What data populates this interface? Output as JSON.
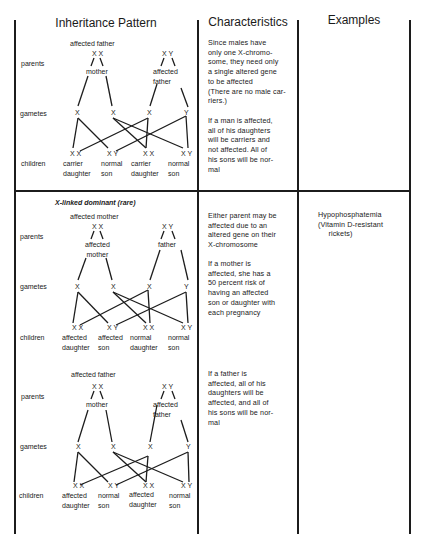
{
  "table": {
    "headers": [
      "Inheritance Pattern",
      "Characteristics",
      "Examples"
    ],
    "sections": [
      {
        "id": "x-linked-recessive-father",
        "title": "",
        "row_labels": {
          "parents": "parents",
          "gametes": "gametes",
          "children": "children"
        },
        "parent_left_label_top": "affected father",
        "parent_left_genotype": "X X",
        "parent_left_label_bottom": "mother",
        "parent_right_genotype": "X Y",
        "parent_right_label": "affected\nfather",
        "gametes": [
          "X",
          "X",
          "X",
          "Y"
        ],
        "children_genotypes": [
          "X X",
          "X Y",
          "X X",
          "X Y"
        ],
        "children_labels": [
          "carrier\ndaughter",
          "normal\nson",
          "carrier\ndaughter",
          "normal\nson"
        ],
        "characteristics": [
          "Since males have\nonly one X-chromo-\nsome, they need only\na single altered gene\nto be affected\n(There are no male car-\nriers.)",
          "If a man is affected,\nall of his daughters\nwill be carriers and\nnot affected. All of\nhis sons will be nor-\nmal"
        ],
        "examples": ""
      },
      {
        "id": "x-linked-dominant-mother",
        "title": "X-linked dominant (rare)",
        "row_labels": {
          "parents": "parents",
          "gametes": "gametes",
          "children": "children"
        },
        "parent_left_label_top": "affected mother",
        "parent_left_genotype": "X X",
        "parent_left_label_bottom": "affected\nmother",
        "parent_right_genotype": "X Y",
        "parent_right_label": "father",
        "gametes": [
          "X",
          "X",
          "X",
          "Y"
        ],
        "children_genotypes": [
          "X X",
          "X Y",
          "X X",
          "X Y"
        ],
        "children_labels": [
          "affected\ndaughter",
          "affected\nson",
          "normal\ndaughter",
          "normal\nson"
        ],
        "characteristics": [
          "Either parent may be\naffected due to an\naltered gene on their\nX-chromosome",
          "If a mother is\naffected, she has a\n50 percent risk of\nhaving an affected\nson or daughter with\neach pregnancy"
        ],
        "examples": "Hypophosphatemia\n(Vitamin D-resistant\n     rickets)"
      },
      {
        "id": "x-linked-dominant-father",
        "title": "",
        "row_labels": {
          "parents": "parents",
          "gametes": "gametes",
          "children": "children"
        },
        "parent_left_label_top": "affected father",
        "parent_left_genotype": "X X",
        "parent_left_label_bottom": "mother",
        "parent_right_genotype": "X Y",
        "parent_right_label": "affected\nfather",
        "gametes": [
          "X",
          "X",
          "X",
          "Y"
        ],
        "children_genotypes": [
          "X X",
          "X Y",
          "X X",
          "X Y"
        ],
        "children_labels": [
          "affected\ndaughter",
          "normal\nson",
          "affected\ndaughter",
          "normal\nson"
        ],
        "characteristics": [
          "If a father is\naffected, all of his\ndaughters will be\naffected, and all of\nhis sons will be nor-\nmal"
        ],
        "examples": ""
      }
    ]
  }
}
